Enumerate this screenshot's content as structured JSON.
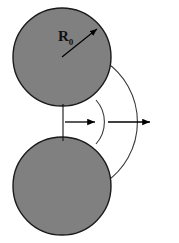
{
  "figure": {
    "width": 179,
    "height": 243,
    "background_color": "#ffffff"
  },
  "labels": {
    "radius_symbol": "R",
    "radius_subscript": "0",
    "radius_full": "R0"
  },
  "colors": {
    "sphere_fill": "#808080",
    "sphere_stroke": "#1a1a1a",
    "arc_stroke": "#3a3a3a",
    "arrow_stroke": "#000000",
    "label_color": "#111111"
  },
  "shapes": {
    "upper_circle": {
      "name": "upper-sphere",
      "cx": 62,
      "cy": 57,
      "r": 49
    },
    "lower_circle": {
      "name": "lower-sphere",
      "cx": 62,
      "cy": 186,
      "r": 49
    },
    "contact_point": {
      "x": 62,
      "y": 122
    },
    "inner_arc": {
      "name": "inner-range-arc",
      "start_x": 96,
      "start_y": 100,
      "end_x": 96,
      "end_y": 144,
      "radius": 33,
      "bulge": "right"
    },
    "outer_arc": {
      "name": "outer-range-arc",
      "start_x": 106,
      "start_y": 62,
      "end_x": 106,
      "end_y": 182,
      "radius": 73,
      "bulge": "right"
    },
    "contact_line": {
      "name": "contact-vertical-line",
      "x": 63,
      "y1": 104,
      "y2": 141
    },
    "radius_arrow": {
      "name": "radius-arrow",
      "x1": 62,
      "y1": 57,
      "x2": 99,
      "y2": 28
    },
    "inner_arrow": {
      "name": "inner-range-arrow",
      "x1": 64,
      "y1": 122,
      "x2": 97,
      "y2": 122
    },
    "outer_arrow": {
      "name": "outer-range-arrow",
      "x1": 107,
      "y1": 122,
      "x2": 152,
      "y2": 122
    },
    "radius_label_position": {
      "x": 58,
      "y": 40
    }
  }
}
